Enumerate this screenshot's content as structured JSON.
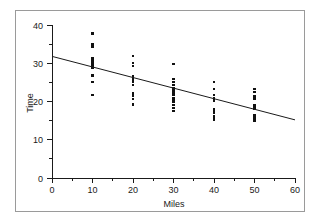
{
  "figure": {
    "background_color": "#ffffff",
    "border_color": "#9a9a9a",
    "ink_color": "#1a1a1a"
  },
  "chart_data": {
    "type": "scatter",
    "title": "",
    "xlabel": "Miles",
    "ylabel": "Time",
    "xlim": [
      0,
      60
    ],
    "ylim": [
      0,
      40
    ],
    "xticks": [
      0,
      10,
      20,
      30,
      40,
      50,
      60
    ],
    "yticks": [
      0,
      10,
      20,
      30,
      40
    ],
    "xminor_ticks": [
      5,
      15,
      25,
      35,
      45,
      55
    ],
    "yminor_ticks": [
      5,
      15,
      25,
      35
    ],
    "grid": false,
    "legend": null,
    "marker": "square",
    "marker_color": "#111111",
    "series": [
      {
        "name": "Observations",
        "points": [
          [
            10,
            37.8
          ],
          [
            10,
            34.9
          ],
          [
            10,
            34.3
          ],
          [
            10,
            31.3
          ],
          [
            10,
            30.7
          ],
          [
            10,
            30.1
          ],
          [
            10,
            29.5
          ],
          [
            10,
            29.2
          ],
          [
            10,
            28.8
          ],
          [
            10,
            26.8
          ],
          [
            10,
            25.0
          ],
          [
            10,
            21.7
          ],
          [
            20,
            32.0
          ],
          [
            20,
            30.1
          ],
          [
            20,
            29.3
          ],
          [
            20,
            26.6
          ],
          [
            20,
            26.1
          ],
          [
            20,
            25.6
          ],
          [
            20,
            25.1
          ],
          [
            20,
            24.4
          ],
          [
            20,
            22.1
          ],
          [
            20,
            21.5
          ],
          [
            20,
            20.6
          ],
          [
            20,
            19.2
          ],
          [
            30,
            29.9
          ],
          [
            30,
            25.8
          ],
          [
            30,
            25.1
          ],
          [
            30,
            24.4
          ],
          [
            30,
            23.4
          ],
          [
            30,
            22.6
          ],
          [
            30,
            22.1
          ],
          [
            30,
            21.6
          ],
          [
            30,
            21.0
          ],
          [
            30,
            20.4
          ],
          [
            30,
            19.8
          ],
          [
            30,
            19.1
          ],
          [
            30,
            18.4
          ],
          [
            30,
            17.6
          ],
          [
            40,
            25.1
          ],
          [
            40,
            23.3
          ],
          [
            40,
            21.6
          ],
          [
            40,
            21.0
          ],
          [
            40,
            20.6
          ],
          [
            40,
            20.1
          ],
          [
            40,
            18.1
          ],
          [
            40,
            17.4
          ],
          [
            40,
            16.9
          ],
          [
            40,
            16.3
          ],
          [
            40,
            15.8
          ],
          [
            40,
            15.1
          ],
          [
            50,
            23.2
          ],
          [
            50,
            22.5
          ],
          [
            50,
            21.3
          ],
          [
            50,
            20.8
          ],
          [
            50,
            19.0
          ],
          [
            50,
            18.6
          ],
          [
            50,
            18.1
          ],
          [
            50,
            16.5
          ],
          [
            50,
            15.9
          ],
          [
            50,
            15.3
          ],
          [
            50,
            14.9
          ]
        ]
      }
    ],
    "fit_line": {
      "type": "linear-regression",
      "x_start": 0,
      "y_start": 31.8,
      "x_end": 60,
      "y_end": 15.2,
      "slope": -0.2767,
      "intercept": 31.8
    }
  }
}
